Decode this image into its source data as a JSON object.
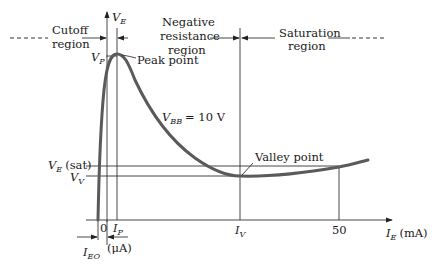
{
  "diagram": {
    "type": "UJT emitter characteristic curve",
    "y_axis": {
      "label": "V",
      "label_sub": "E"
    },
    "x_axis": {
      "label": "I",
      "label_sub": "E",
      "unit": "(mA)",
      "ticks": [
        "0",
        "50"
      ]
    },
    "regions": {
      "cutoff": {
        "line1": "Cutoff",
        "line2": "region"
      },
      "negative": {
        "line1": "Negative",
        "line2": "resistance",
        "line3": "region"
      },
      "saturation": {
        "line1": "Saturation",
        "line2": "region"
      }
    },
    "annotations": {
      "vp": {
        "main": "V",
        "sub": "P"
      },
      "peak_point": "Peak point",
      "vbb": {
        "main": "V",
        "sub": "BB",
        "value": "= 10 V"
      },
      "valley_point": "Valley point",
      "ve_sat": {
        "main": "V",
        "sub": "E",
        "suffix": "(sat)"
      },
      "vv": {
        "main": "V",
        "sub": "V"
      },
      "ip": {
        "main": "I",
        "sub": "P"
      },
      "iv": {
        "main": "I",
        "sub": "V"
      },
      "ieo": {
        "main": "I",
        "sub": "EO"
      },
      "micro_amp": "(μA)"
    },
    "colors": {
      "curve": "#5a5a5a",
      "lines": "#333333"
    }
  }
}
